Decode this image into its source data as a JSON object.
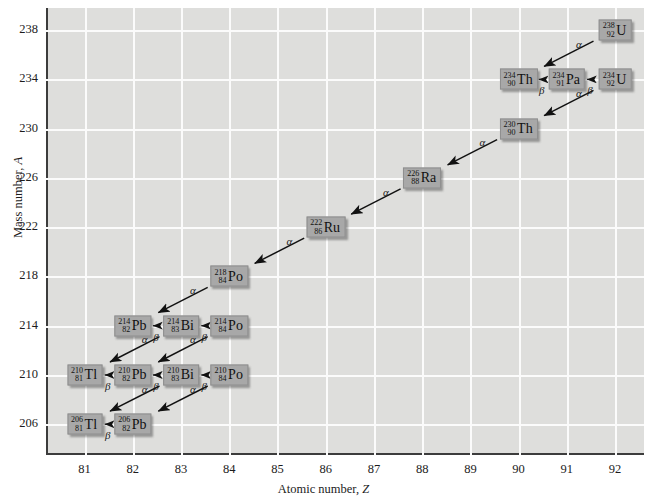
{
  "figure": {
    "axes": {
      "x": {
        "label_prefix": "Atomic number, ",
        "label_symbol": "Z",
        "ticks": [
          "81",
          "82",
          "83",
          "84",
          "85",
          "86",
          "87",
          "88",
          "89",
          "90",
          "91",
          "92"
        ],
        "min": 80.2,
        "max": 92.6
      },
      "y": {
        "label_prefix": "Mass number, ",
        "label_symbol": "A",
        "ticks": [
          "206",
          "210",
          "214",
          "218",
          "222",
          "226",
          "230",
          "234",
          "238"
        ],
        "min": 203.5,
        "max": 239.8
      },
      "grid": true,
      "plot_background": "#dededc",
      "gridline_color": "#fbfbfb",
      "axis_color": "#3c3c3c"
    }
  },
  "chart_data": {
    "type": "scatter",
    "xlabel": "Atomic number, Z",
    "ylabel": "Mass number, A",
    "xlim": [
      80.2,
      92.6
    ],
    "ylim": [
      203.5,
      239.8
    ],
    "grid": true,
    "nuclides": [
      {
        "id": "U238",
        "mass": "238",
        "z": "92",
        "symbol": "U",
        "x": 92,
        "y": 238
      },
      {
        "id": "Th234",
        "mass": "234",
        "z": "90",
        "symbol": "Th",
        "x": 90,
        "y": 234
      },
      {
        "id": "Pa234",
        "mass": "234",
        "z": "91",
        "symbol": "Pa",
        "x": 91,
        "y": 234
      },
      {
        "id": "U234",
        "mass": "234",
        "z": "92",
        "symbol": "U",
        "x": 92,
        "y": 234
      },
      {
        "id": "Th230",
        "mass": "230",
        "z": "90",
        "symbol": "Th",
        "x": 90,
        "y": 230
      },
      {
        "id": "Ra226",
        "mass": "226",
        "z": "88",
        "symbol": "Ra",
        "x": 88,
        "y": 226
      },
      {
        "id": "Ru222",
        "mass": "222",
        "z": "86",
        "symbol": "Ru",
        "x": 86,
        "y": 222
      },
      {
        "id": "Po218",
        "mass": "218",
        "z": "84",
        "symbol": "Po",
        "x": 84,
        "y": 218
      },
      {
        "id": "Pb214",
        "mass": "214",
        "z": "82",
        "symbol": "Pb",
        "x": 82,
        "y": 214
      },
      {
        "id": "Bi214",
        "mass": "214",
        "z": "83",
        "symbol": "Bi",
        "x": 83,
        "y": 214
      },
      {
        "id": "Po214",
        "mass": "214",
        "z": "84",
        "symbol": "Po",
        "x": 84,
        "y": 214
      },
      {
        "id": "Tl210",
        "mass": "210",
        "z": "81",
        "symbol": "Tl",
        "x": 81,
        "y": 210
      },
      {
        "id": "Pb210",
        "mass": "210",
        "z": "82",
        "symbol": "Pb",
        "x": 82,
        "y": 210
      },
      {
        "id": "Bi210",
        "mass": "210",
        "z": "83",
        "symbol": "Bi",
        "x": 83,
        "y": 210
      },
      {
        "id": "Po210",
        "mass": "210",
        "z": "84",
        "symbol": "Po",
        "x": 84,
        "y": 210
      },
      {
        "id": "Tl206",
        "mass": "206",
        "z": "81",
        "symbol": "Tl",
        "x": 81,
        "y": 206
      },
      {
        "id": "Pb206",
        "mass": "206",
        "z": "82",
        "symbol": "Pb",
        "x": 82,
        "y": 206
      }
    ],
    "decays": [
      {
        "from": "U238",
        "to": "Th234",
        "type": "alpha",
        "label": "α",
        "label_pos": "upper"
      },
      {
        "from": "Th234",
        "to": "Pa234",
        "type": "beta",
        "label": "β",
        "label_pos": "below"
      },
      {
        "from": "Pa234",
        "to": "U234",
        "type": "beta",
        "label": "β",
        "label_pos": "below"
      },
      {
        "from": "U234",
        "to": "Th230",
        "type": "alpha",
        "label": "α",
        "label_pos": "upper"
      },
      {
        "from": "Th230",
        "to": "Ra226",
        "type": "alpha",
        "label": "α",
        "label_pos": "upper"
      },
      {
        "from": "Ra226",
        "to": "Ru222",
        "type": "alpha",
        "label": "α",
        "label_pos": "upper"
      },
      {
        "from": "Ru222",
        "to": "Po218",
        "type": "alpha",
        "label": "α",
        "label_pos": "upper"
      },
      {
        "from": "Po218",
        "to": "Pb214",
        "type": "alpha",
        "label": "α",
        "label_pos": "upper"
      },
      {
        "from": "Pb214",
        "to": "Bi214",
        "type": "beta",
        "label": "β",
        "label_pos": "below"
      },
      {
        "from": "Bi214",
        "to": "Po214",
        "type": "beta",
        "label": "β",
        "label_pos": "below"
      },
      {
        "from": "Bi214",
        "to": "Tl210",
        "type": "alpha",
        "label": "α",
        "label_pos": "upper"
      },
      {
        "from": "Po214",
        "to": "Pb210",
        "type": "alpha",
        "label": "α",
        "label_pos": "upper"
      },
      {
        "from": "Tl210",
        "to": "Pb210",
        "type": "beta",
        "label": "β",
        "label_pos": "below"
      },
      {
        "from": "Pb210",
        "to": "Bi210",
        "type": "beta",
        "label": "β",
        "label_pos": "below"
      },
      {
        "from": "Bi210",
        "to": "Po210",
        "type": "beta",
        "label": "β",
        "label_pos": "below"
      },
      {
        "from": "Bi210",
        "to": "Tl206",
        "type": "alpha",
        "label": "α",
        "label_pos": "upper"
      },
      {
        "from": "Po210",
        "to": "Pb206",
        "type": "alpha",
        "label": "α",
        "label_pos": "upper"
      },
      {
        "from": "Tl206",
        "to": "Pb206",
        "type": "beta",
        "label": "β",
        "label_pos": "below"
      }
    ]
  }
}
